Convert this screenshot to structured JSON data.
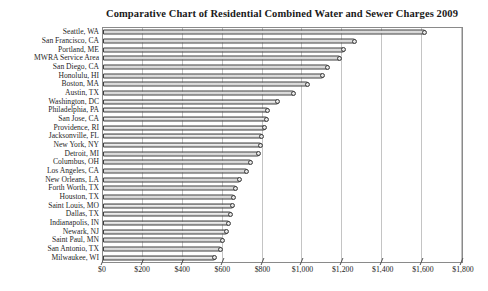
{
  "chart_data": {
    "type": "bar",
    "orientation": "horizontal",
    "title": "Comparative Chart of Residential Combined Water and Sewer Charges 2009",
    "categories": [
      "Seattle, WA",
      "San Francisco, CA",
      "Portland, ME",
      "MWRA Service Area",
      "San Diego, CA",
      "Honolulu, HI",
      "Boston, MA",
      "Austin, TX",
      "Washington, DC",
      "Philadelphia, PA",
      "San Jose, CA",
      "Providence, RI",
      "Jacksonville, FL",
      "New York, NY",
      "Detroit, MI",
      "Columbus, OH",
      "Los Angeles, CA",
      "New Orleans, LA",
      "Forth Worth, TX",
      "Houston, TX",
      "Saint Louis, MO",
      "Dallas, TX",
      "Indianapolis, IN",
      "Newark, NJ",
      "Saint Paul, MN",
      "San Antonio, TX",
      "Milwaukee, WI"
    ],
    "values": [
      1620,
      1270,
      1215,
      1195,
      1135,
      1110,
      1035,
      965,
      880,
      830,
      825,
      815,
      800,
      795,
      788,
      748,
      728,
      693,
      672,
      662,
      655,
      645,
      635,
      625,
      608,
      598,
      565
    ],
    "xlabel": "",
    "ylabel": "",
    "xlim": [
      0,
      1800
    ],
    "x_tick_step": 200,
    "x_tick_labels": [
      "$0",
      "$200",
      "$400",
      "$600",
      "$800",
      "$1,000",
      "$1,200",
      "$1,400",
      "$1,600",
      "$1,800"
    ],
    "grid": "vertical",
    "legend": "none",
    "colors": {
      "bar_fill": "#d9d9d9",
      "bar_border": "#3f3f3f",
      "gridline": "#c4c4c4",
      "plot_border": "#8a8a8a",
      "tick": "#555555",
      "text": "#1f1f1f"
    }
  }
}
